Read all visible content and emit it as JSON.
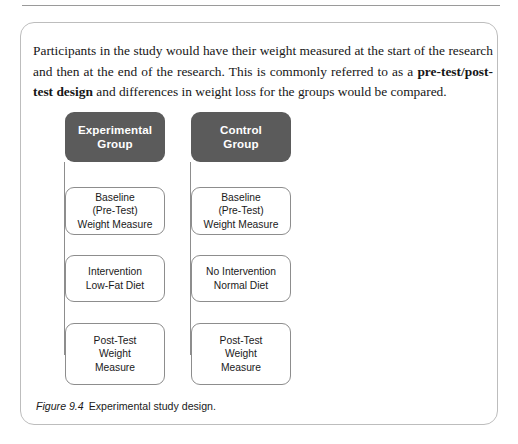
{
  "figure": {
    "intro_paragraph_parts": [
      {
        "text": "Participants in the study would have their weight measured at the start of the research and then at the end of the research. This is commonly referred to as a ",
        "bold": false
      },
      {
        "text": "pre-test/post-test design",
        "bold": true
      },
      {
        "text": " and differences in weight loss for the groups would be compared.",
        "bold": false
      }
    ],
    "caption_label": "Figure 9.4",
    "caption_text": "Experimental study design.",
    "colors": {
      "header_box_fill": "#5b5b5b",
      "header_box_text": "#ffffff",
      "node_box_border": "#8d8d8d",
      "node_box_fill": "#ffffff",
      "connector_line": "#8d8d8d",
      "card_border": "#bdbdbd",
      "rule": "#9a9a9a",
      "body_text": "#161616"
    },
    "columns": [
      {
        "id": "experimental",
        "header": "Experimental\nGroup",
        "nodes": [
          {
            "id": "baseline",
            "label": "Baseline\n(Pre-Test)\nWeight Measure"
          },
          {
            "id": "intervention",
            "label": "Intervention\nLow-Fat Diet"
          },
          {
            "id": "post-test",
            "label": "Post-Test\nWeight\nMeasure"
          }
        ]
      },
      {
        "id": "control",
        "header": "Control\nGroup",
        "nodes": [
          {
            "id": "baseline",
            "label": "Baseline\n(Pre-Test)\nWeight Measure"
          },
          {
            "id": "no-intervention",
            "label": "No Intervention\nNormal Diet"
          },
          {
            "id": "post-test",
            "label": "Post-Test\nWeight\nMeasure"
          }
        ]
      }
    ]
  }
}
